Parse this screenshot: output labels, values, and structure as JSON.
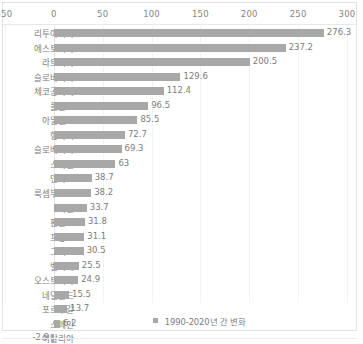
{
  "colors": {
    "bar": "#a8a8a8",
    "text": "#7c7c7c",
    "axis_text": "#868686",
    "gridline": "#f3f3f3",
    "frame": "#e2e2e2",
    "background": "#ffffff"
  },
  "legend": {
    "swatch_icon": "square-swatch-icon",
    "label": "1990-2020년 간 변화"
  },
  "chart_data": {
    "type": "bar",
    "orientation": "horizontal",
    "title": "",
    "xlabel": "",
    "ylabel": "",
    "xlim": [
      -50,
      300
    ],
    "xticks": [
      -50,
      0,
      50,
      100,
      150,
      200,
      250,
      300
    ],
    "xtick_labels": [
      "-50",
      "0",
      "50",
      "100",
      "150",
      "200",
      "250",
      "300"
    ],
    "grid": true,
    "legend_position": "bottom",
    "series": [
      {
        "name": "1990-2020년 간 변화",
        "values": [
          276.3,
          237.2,
          200.5,
          129.6,
          112.4,
          96.5,
          85.5,
          72.7,
          69.3,
          63,
          38.7,
          38.2,
          33.7,
          31.8,
          31.1,
          30.5,
          25.5,
          24.9,
          15.5,
          13.7,
          6.2,
          -2.9
        ]
      }
    ],
    "categories": [
      "리투아니아",
      "에스토니아",
      "라트비아",
      "슬로바키아",
      "체코공화국",
      "폴란드",
      "아일랜드",
      "헝가리",
      "슬로베니아",
      "스웨덴",
      "덴마크",
      "룩셈부르크",
      "독일",
      "핀란드",
      "프랑스",
      "그리스",
      "벨기에",
      "오스트리아",
      "네덜란드",
      "포르투갈",
      "스페인",
      "이탈리아"
    ],
    "data_labels": [
      "276.3",
      "237.2",
      "200.5",
      "129.6",
      "112.4",
      "96.5",
      "85.5",
      "72.7",
      "69.3",
      "63",
      "38.7",
      "38.2",
      "33.7",
      "31.8",
      "31.1",
      "30.5",
      "25.5",
      "24.9",
      "15.5",
      "13.7",
      "6.2",
      "-2.9"
    ]
  }
}
